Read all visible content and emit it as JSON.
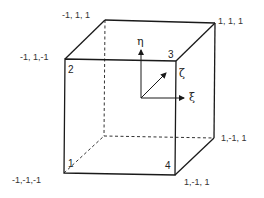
{
  "diagram": {
    "type": "hexahedral element (cube) with natural coordinates",
    "vertex_labels": {
      "back_top_left": "-1, 1, 1",
      "back_top_right": "1, 1, 1",
      "front_top_left": "-1, 1,-1",
      "back_bottom_right": "1,-1, 1",
      "front_bottom_left": "-1,-1,-1",
      "front_bottom_right": "1,-1, 1"
    },
    "node_numbers": {
      "node1": "1",
      "node2": "2",
      "node3": "3",
      "node4": "4"
    },
    "axes": {
      "eta": "η",
      "xi": "ξ",
      "zeta": "ζ"
    },
    "colors": {
      "line": "#1a1a1a",
      "text": "#333333",
      "background": "#ffffff"
    }
  }
}
